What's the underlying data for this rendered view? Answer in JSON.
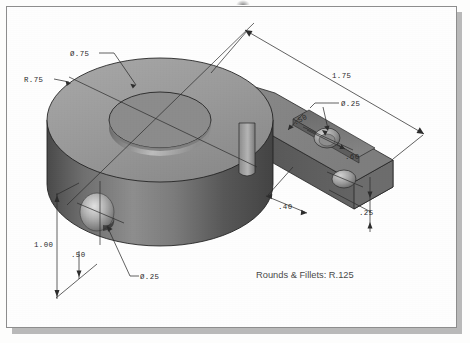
{
  "document": {
    "kind": "isometric-technical-drawing",
    "note": "Rounds & Fillets: R.125"
  },
  "dimensions": [
    {
      "id": "bore-dia",
      "label": "Ø.75",
      "target": "top-center-bore"
    },
    {
      "id": "boss-radius",
      "label": "R.75",
      "target": "cylindrical-boss-outer-radius"
    },
    {
      "id": "overall-length",
      "label": "1.75",
      "target": "overall-arm-length"
    },
    {
      "id": "arm-hole-dia",
      "label": "Ø.25",
      "target": "arm-through-hole"
    },
    {
      "id": "slot-width",
      "label": ".50",
      "target": "arm-slot-width"
    },
    {
      "id": "hole-offset",
      "label": ".60",
      "target": "arm-hole-offset"
    },
    {
      "id": "slot-position",
      "label": ".40",
      "target": "arm-slot-position"
    },
    {
      "id": "arm-thickness",
      "label": ".25",
      "target": "arm-plate-thickness"
    },
    {
      "id": "overall-height",
      "label": "1.00",
      "target": "boss-overall-height"
    },
    {
      "id": "side-hole-ht",
      "label": ".50",
      "target": "side-hole-center-height"
    },
    {
      "id": "side-hole-dia",
      "label": "Ø.25",
      "target": "boss-side-hole"
    }
  ],
  "colors": {
    "top_face": "#9d9d9d",
    "front_face": "#5d5d5d",
    "right_face": "#727272",
    "highlight": "#c9c9c9",
    "shadow": "#3e3e3e",
    "line": "#2d2d2d",
    "note": "#4a4a4a",
    "frame_border": "#8d8d8d",
    "page": "#fefefe"
  }
}
